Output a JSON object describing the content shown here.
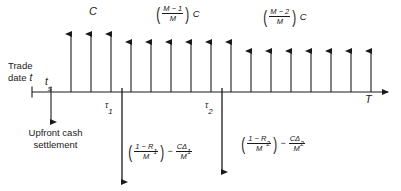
{
  "figure": {
    "type": "cash-flow-timeline",
    "title_text": "",
    "axis": {
      "start_label": "Trade date t",
      "start_label_line1": "Trade",
      "start_label_line2": "date",
      "start_symbol": "t",
      "settlement_tick_label": "t",
      "settlement_tick_sub": "s",
      "end_label": "T"
    },
    "upfront": {
      "label_line1": "Upfront cash",
      "label_line2": "settlement",
      "direction": "down"
    },
    "coupon_labels": [
      {
        "id": "coupon-full",
        "text": "C",
        "kind": "plain",
        "x": 95,
        "y": 8
      },
      {
        "id": "coupon-m1",
        "kind": "fraction",
        "numerator": "M − 1",
        "denominator": "M",
        "suffix": "C",
        "x": 160,
        "y": 6
      },
      {
        "id": "coupon-m2",
        "kind": "fraction",
        "numerator": "M − 2",
        "denominator": "M",
        "suffix": "C",
        "x": 265,
        "y": 9
      }
    ],
    "default_payments": [
      {
        "id": "default-payment-1",
        "at_tick": "τ₁",
        "tick_symbol": "τ",
        "tick_sub": "1",
        "term1_num": "1 − R",
        "term1_num_sub": "1",
        "term1_den": "M",
        "operator": "−",
        "term2_num": "CΔ",
        "term2_num_sub": "1",
        "term2_den": "M",
        "x": 122
      },
      {
        "id": "default-payment-2",
        "at_tick": "τ₂",
        "tick_symbol": "τ",
        "tick_sub": "2",
        "term1_num": "1 − R",
        "term1_num_sub": "2",
        "term1_den": "M",
        "operator": "−",
        "term2_num": "CΔ",
        "term2_num_sub": "2",
        "term2_den": "M",
        "x": 222
      }
    ],
    "colors": {
      "ink": "#1a1a1a",
      "background": "#ffffff"
    },
    "geometry": {
      "axis_y": 92,
      "axis_x_start": 32,
      "axis_x_end": 392,
      "settlement_x": 51,
      "first_coupon_x": 71,
      "coupon_spacing": 20,
      "coupon_count": 16,
      "tall_top_y": 32,
      "mid_top_y": 38,
      "short_top_y": 46
    }
  }
}
